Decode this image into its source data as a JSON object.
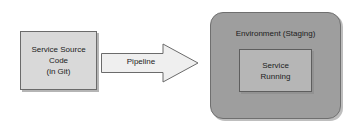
{
  "diagram": {
    "source_box": {
      "name": "service-source-code",
      "lines": [
        "Service Source",
        "Code",
        "(in Git)"
      ],
      "fill": "#d9d9d9",
      "stroke": "#6b6b6b"
    },
    "arrow": {
      "name": "pipeline-arrow",
      "label": "Pipeline",
      "direction": "right",
      "fill": "#efefef",
      "stroke": "#6b6b6b"
    },
    "environment": {
      "name": "environment-panel",
      "label": "Environment (Staging)",
      "fill": "#9e9e9e",
      "stroke": "#6f6f6f",
      "inner_box": {
        "name": "service-running",
        "lines": [
          "Service",
          "Running"
        ],
        "fill": "#b6b6b6",
        "stroke": "#5e5e5e"
      }
    }
  }
}
